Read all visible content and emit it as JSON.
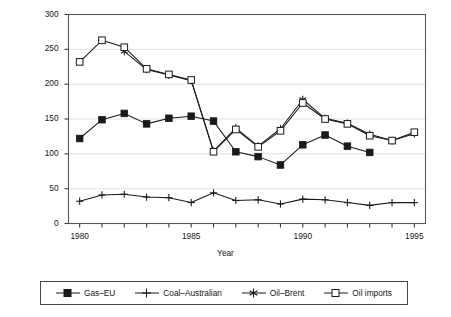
{
  "chart_data": {
    "type": "line",
    "title": "",
    "xlabel": "Year",
    "ylabel": "$ per tonne oil equivalent",
    "xlim": [
      1979.5,
      1995.5
    ],
    "ylim": [
      0,
      300
    ],
    "yticks": [
      0,
      50,
      100,
      150,
      200,
      250,
      300
    ],
    "ytick_labels": [
      "0",
      "50",
      "100",
      "150",
      "200",
      "250",
      "300"
    ],
    "xticks": [
      1980,
      1981,
      1982,
      1983,
      1984,
      1985,
      1986,
      1987,
      1988,
      1989,
      1990,
      1991,
      1992,
      1993,
      1994,
      1995
    ],
    "xtick_labels_shown": [
      "1980",
      "1985",
      "1990",
      "1995"
    ],
    "xtick_labels_shown_values": [
      1980,
      1985,
      1990,
      1995
    ],
    "grid": "horizontal",
    "legend_position": "below",
    "series": [
      {
        "name": "Gas–EU",
        "marker": "filled-square",
        "color": "#1a1a1a",
        "x": [
          1980,
          1981,
          1982,
          1983,
          1984,
          1985,
          1986,
          1987,
          1988,
          1989,
          1990,
          1991,
          1992,
          1993
        ],
        "values": [
          122,
          149,
          158,
          143,
          151,
          154,
          147,
          103,
          96,
          84,
          113,
          127,
          111,
          102
        ]
      },
      {
        "name": "Coal–Australian",
        "marker": "plus",
        "color": "#1a1a1a",
        "x": [
          1980,
          1981,
          1982,
          1983,
          1984,
          1985,
          1986,
          1987,
          1988,
          1989,
          1990,
          1991,
          1992,
          1993,
          1994,
          1995
        ],
        "values": [
          32,
          41,
          42,
          38,
          37,
          30,
          44,
          33,
          34,
          28,
          35,
          34,
          30,
          26,
          30,
          30
        ]
      },
      {
        "name": "Oil–Brent",
        "marker": "asterisk",
        "color": "#1a1a1a",
        "x": [
          1982,
          1983,
          1984,
          1985,
          1986,
          1987,
          1988,
          1989,
          1990,
          1991,
          1992,
          1993,
          1994,
          1995
        ],
        "values": [
          247,
          221,
          213,
          205,
          104,
          137,
          111,
          136,
          178,
          151,
          144,
          128,
          119,
          129
        ]
      },
      {
        "name": "Oil imports",
        "marker": "open-square",
        "color": "#1a1a1a",
        "x": [
          1980,
          1981,
          1982,
          1983,
          1984,
          1985,
          1986,
          1987,
          1988,
          1989,
          1990,
          1991,
          1992,
          1993,
          1994,
          1995
        ],
        "values": [
          232,
          263,
          253,
          222,
          214,
          206,
          103,
          135,
          110,
          133,
          173,
          150,
          143,
          126,
          119,
          131
        ]
      }
    ]
  },
  "axes": {
    "ylabel": "$ per tonne oil equivalent",
    "xlabel": "Year"
  },
  "legend": {
    "entries": [
      {
        "label": "Gas–EU",
        "marker": "filled-square"
      },
      {
        "label": "Coal–Australian",
        "marker": "plus"
      },
      {
        "label": "Oil–Brent",
        "marker": "asterisk"
      },
      {
        "label": "Oil imports",
        "marker": "open-square"
      }
    ]
  }
}
